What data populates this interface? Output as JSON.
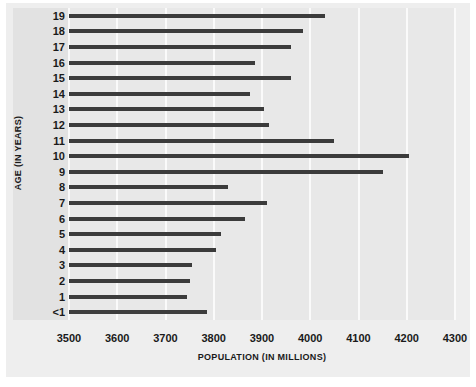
{
  "chart_data": {
    "type": "bar",
    "orientation": "horizontal",
    "title": "",
    "xlabel": "POPULATION (IN MILLIONS)",
    "ylabel": "AGE (IN YEARS)",
    "xlim": [
      3500,
      4300
    ],
    "xticks": [
      3500,
      3600,
      3700,
      3800,
      3900,
      4000,
      4100,
      4200,
      4300
    ],
    "xtick_labels": [
      "3500",
      "3600",
      "3700",
      "3800",
      "3900",
      "4000",
      "4100",
      "4200",
      "4300"
    ],
    "grid": true,
    "grid_axis": "x",
    "legend": null,
    "categories": [
      "19",
      "18",
      "17",
      "16",
      "15",
      "14",
      "13",
      "12",
      "11",
      "10",
      "9",
      "8",
      "7",
      "6",
      "5",
      "4",
      "3",
      "2",
      "1",
      "<1"
    ],
    "values": [
      4030,
      3985,
      3960,
      3885,
      3960,
      3875,
      3905,
      3915,
      4050,
      4205,
      4150,
      3830,
      3910,
      3865,
      3815,
      3805,
      3755,
      3750,
      3745,
      3785
    ],
    "bar_color": "#3b3b3b",
    "plot_background": "#e8e8e8",
    "figure_background": "#eeeeee",
    "gridline_color": "#fafafa"
  }
}
